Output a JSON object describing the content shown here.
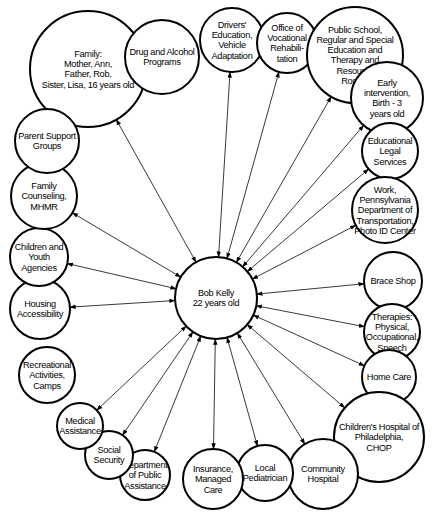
{
  "center": {
    "id": "bob",
    "lines": [
      "Bob Kelly",
      "22 years old"
    ],
    "x": 216,
    "y": 298,
    "r": 41
  },
  "nodes": [
    {
      "id": "family",
      "lines": [
        "Family:",
        "Mother, Ann,",
        "Father, Rob,",
        "Sister, Lisa, 16 years old"
      ],
      "x": 88,
      "y": 69,
      "r": 58,
      "arrow": true
    },
    {
      "id": "drug",
      "lines": [
        "Drug and Alcohol",
        "Programs"
      ],
      "x": 162,
      "y": 57,
      "r": 37,
      "arrow": false
    },
    {
      "id": "drivers",
      "lines": [
        "Drivers'",
        "Education,",
        "Vehicle",
        "Adaptation"
      ],
      "x": 232,
      "y": 40,
      "r": 32,
      "arrow": true
    },
    {
      "id": "ovr",
      "lines": [
        "Office of",
        "Vocational",
        "Rehabili-",
        "tation"
      ],
      "x": 287,
      "y": 43,
      "r": 30,
      "arrow": true
    },
    {
      "id": "school",
      "lines": [
        "Public School,",
        "Regular and Special",
        "Education and",
        "Therapy and",
        "Resource",
        "Rooms"
      ],
      "x": 355,
      "y": 55,
      "r": 48,
      "arrow": true
    },
    {
      "id": "early",
      "lines": [
        "Early",
        "intervention,",
        "Birth - 3",
        "years old"
      ],
      "x": 387,
      "y": 98,
      "r": 36,
      "arrow": true
    },
    {
      "id": "legal",
      "lines": [
        "Educational",
        "Legal",
        "Services"
      ],
      "x": 390,
      "y": 151,
      "r": 28,
      "arrow": true
    },
    {
      "id": "work",
      "lines": [
        "Work,",
        "Pennsylvania",
        "Department of",
        "Transportation,",
        "Photo ID Center"
      ],
      "x": 385,
      "y": 210,
      "r": 33,
      "arrow": true
    },
    {
      "id": "brace",
      "lines": [
        "Brace Shop"
      ],
      "x": 393,
      "y": 281,
      "r": 29,
      "arrow": true
    },
    {
      "id": "therapies",
      "lines": [
        "Therapies:",
        "Physical,",
        "Occupational,",
        "Speech"
      ],
      "x": 392,
      "y": 332,
      "r": 28,
      "arrow": true
    },
    {
      "id": "homecare",
      "lines": [
        "Home Care"
      ],
      "x": 389,
      "y": 377,
      "r": 27,
      "arrow": true
    },
    {
      "id": "chop",
      "lines": [
        "Children's Hospital of",
        "Philadelphia,",
        "CHOP"
      ],
      "x": 379,
      "y": 437,
      "r": 45,
      "arrow": true
    },
    {
      "id": "community",
      "lines": [
        "Community",
        "Hospital"
      ],
      "x": 323,
      "y": 474,
      "r": 35,
      "arrow": true
    },
    {
      "id": "pediatrician",
      "lines": [
        "Local",
        "Pediatrician"
      ],
      "x": 265,
      "y": 473,
      "r": 28,
      "arrow": true
    },
    {
      "id": "insurance",
      "lines": [
        "Insurance,",
        "Managed",
        "Care"
      ],
      "x": 213,
      "y": 479,
      "r": 30,
      "arrow": true
    },
    {
      "id": "dpa",
      "lines": [
        "Department",
        "of Public",
        "Assistance"
      ],
      "x": 145,
      "y": 475,
      "r": 25,
      "arrow": true
    },
    {
      "id": "social",
      "lines": [
        "Social",
        "Security"
      ],
      "x": 109,
      "y": 455,
      "r": 24,
      "arrow": true
    },
    {
      "id": "medical",
      "lines": [
        "Medical",
        "Assistance"
      ],
      "x": 80,
      "y": 426,
      "r": 23,
      "arrow": true
    },
    {
      "id": "recreation",
      "lines": [
        "Recreational",
        "Activities,",
        "Camps"
      ],
      "x": 47,
      "y": 375,
      "r": 28,
      "arrow": false
    },
    {
      "id": "housing",
      "lines": [
        "Housing",
        "Accessibility"
      ],
      "x": 40,
      "y": 309,
      "r": 30,
      "arrow": true
    },
    {
      "id": "children",
      "lines": [
        "Children and",
        "Youth",
        "Agencies"
      ],
      "x": 39,
      "y": 257,
      "r": 29,
      "arrow": true
    },
    {
      "id": "counseling",
      "lines": [
        "Family",
        "Counseling,",
        "MHMR"
      ],
      "x": 44,
      "y": 196,
      "r": 33,
      "arrow": true
    },
    {
      "id": "parent",
      "lines": [
        "Parent Support",
        "Groups"
      ],
      "x": 47,
      "y": 141,
      "r": 32,
      "arrow": false
    }
  ],
  "extra_edges": [
    {
      "from": "drug",
      "to": "family",
      "note": "two arrows into family"
    },
    {
      "from": "family",
      "to": "parent"
    },
    {
      "from": "family",
      "to": "counseling"
    }
  ]
}
